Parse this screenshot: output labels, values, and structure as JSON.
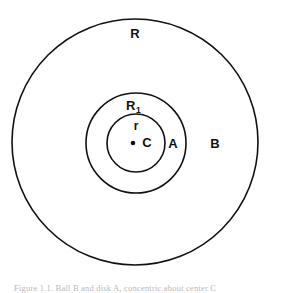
{
  "figure": {
    "background_color": "#ffffff",
    "stroke_color": "#111111",
    "caption_text": "Figure 1.1. Ball B and disk A, concentric about center C",
    "caption_color": "#b9b9b9"
  },
  "chart_data": {
    "type": "diagram",
    "title": "",
    "subtitle": "",
    "xlabel": "",
    "ylabel": "",
    "center_label": "C",
    "shapes": [
      {
        "name": "outer-circle",
        "label": "R",
        "cx": 135,
        "cy": 142,
        "r": 123,
        "stroke_width": 1.6
      },
      {
        "name": "middle-circle",
        "label": "R1",
        "cx": 136,
        "cy": 143,
        "r": 50,
        "stroke_width": 1.6
      },
      {
        "name": "inner-circle",
        "label": "r",
        "cx": 136,
        "cy": 143,
        "r": 29,
        "stroke_width": 1.6
      }
    ],
    "center_point": {
      "name": "center-point",
      "cx": 133,
      "cy": 143,
      "r": 2.3
    },
    "annotations": [
      {
        "key": "outer_radius",
        "text": "R",
        "x": 135,
        "y": 35,
        "font_size": 13
      },
      {
        "key": "middle_radius",
        "text": "R",
        "sub": "1",
        "x": 132,
        "y": 105,
        "font_size": 13
      },
      {
        "key": "inner_radius",
        "text": "r",
        "x": 136,
        "y": 127,
        "font_size": 11
      },
      {
        "key": "center",
        "text": "C",
        "x": 147,
        "y": 144,
        "font_size": 13
      },
      {
        "key": "region_a",
        "text": "A",
        "x": 173,
        "y": 145,
        "font_size": 13
      },
      {
        "key": "region_b",
        "text": "B",
        "x": 215,
        "y": 145,
        "font_size": 13
      }
    ]
  }
}
